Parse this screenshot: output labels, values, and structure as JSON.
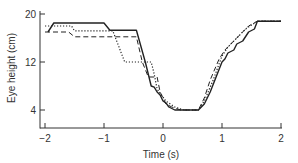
{
  "chart_data": {
    "type": "line",
    "title": "",
    "xlabel": "Time (s)",
    "ylabel": "Eye height (cm)",
    "xlim": [
      -2,
      2
    ],
    "ylim": [
      1.5,
      20
    ],
    "xticks": [
      -2,
      -1,
      0,
      1,
      2
    ],
    "xtick_labels": [
      "−2",
      "−1",
      "0",
      "1",
      "2"
    ],
    "yticks": [
      4,
      12,
      20
    ],
    "ytick_labels": [
      "4",
      "12",
      "20"
    ],
    "grid": false,
    "legend": null,
    "series": [
      {
        "name": "solid",
        "style": "solid",
        "x": [
          -1.95,
          -1.85,
          -1.0,
          -0.9,
          -0.45,
          -0.3,
          -0.2,
          -0.15,
          -0.1,
          -0.05,
          0.0,
          0.05,
          0.1,
          0.2,
          0.6,
          0.7,
          0.8,
          0.9,
          1.0,
          1.05,
          1.1,
          1.2,
          1.25,
          1.35,
          1.45,
          1.55,
          1.6,
          2.0
        ],
        "y": [
          17.0,
          18.5,
          18.5,
          17.3,
          17.3,
          12.0,
          8.0,
          7.8,
          7.0,
          6.5,
          5.5,
          5.2,
          4.5,
          4.0,
          4.0,
          5.0,
          7.0,
          9.5,
          12.0,
          12.5,
          13.5,
          14.0,
          15.0,
          15.5,
          17.0,
          17.5,
          18.8,
          18.8
        ]
      },
      {
        "name": "dashed",
        "style": "dashed",
        "x": [
          -2.0,
          -1.95,
          -1.6,
          -1.5,
          -0.45,
          -0.35,
          -0.25,
          -0.1,
          -0.05,
          0.05,
          0.15,
          0.3,
          0.6,
          0.7,
          0.8,
          0.95,
          1.05,
          1.15,
          1.3,
          1.45,
          1.6,
          2.0
        ],
        "y": [
          17.0,
          17.0,
          17.0,
          16.2,
          16.2,
          12.0,
          9.5,
          9.5,
          7.0,
          5.0,
          4.5,
          4.0,
          4.0,
          6.0,
          9.0,
          12.5,
          14.0,
          15.0,
          16.5,
          18.0,
          18.8,
          18.8
        ]
      },
      {
        "name": "dotted",
        "style": "dotted",
        "x": [
          -2.0,
          -1.55,
          -1.5,
          -0.85,
          -0.65,
          -0.2,
          -0.15,
          -0.1,
          0.05,
          0.2,
          0.35,
          0.6,
          0.7,
          0.85,
          1.0,
          1.1,
          1.25,
          1.4,
          1.6,
          2.0
        ],
        "y": [
          18.0,
          18.0,
          17.2,
          17.2,
          12.0,
          12.0,
          10.0,
          7.5,
          5.5,
          4.5,
          4.0,
          4.0,
          5.5,
          9.0,
          13.0,
          14.5,
          16.0,
          17.5,
          18.8,
          18.8
        ]
      }
    ]
  }
}
